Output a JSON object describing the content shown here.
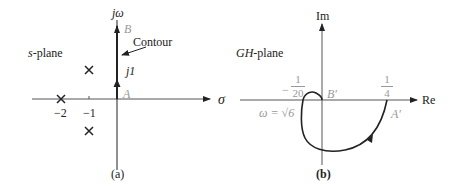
{
  "panel_a": {
    "plane_label_italic": "s",
    "plane_label_rest": "-plane",
    "y_axis_label": "jω",
    "x_axis_label": "σ",
    "point_B": "B",
    "point_A": "A",
    "contour_label": "Contour",
    "j1_label": "j1",
    "tick_neg2": "−2",
    "tick_neg1": "−1",
    "caption": "(a)",
    "poles": [
      {
        "re": -2,
        "im": 0
      },
      {
        "re": -1,
        "im": 1
      },
      {
        "re": -1,
        "im": -1
      }
    ]
  },
  "panel_b": {
    "plane_label_italic": "GH",
    "plane_label_rest": "-plane",
    "y_axis_label": "Im",
    "x_axis_label": "Re",
    "point_B": "B′",
    "point_A": "A′",
    "frac_neg_sign": "−",
    "frac_neg_num": "1",
    "frac_neg_den": "20",
    "frac_pos_num": "1",
    "frac_pos_den": "4",
    "omega_label": "ω = √6",
    "caption": "(b)"
  },
  "colors": {
    "ink": "#222222",
    "gray": "#999999",
    "axis": "#555555"
  }
}
